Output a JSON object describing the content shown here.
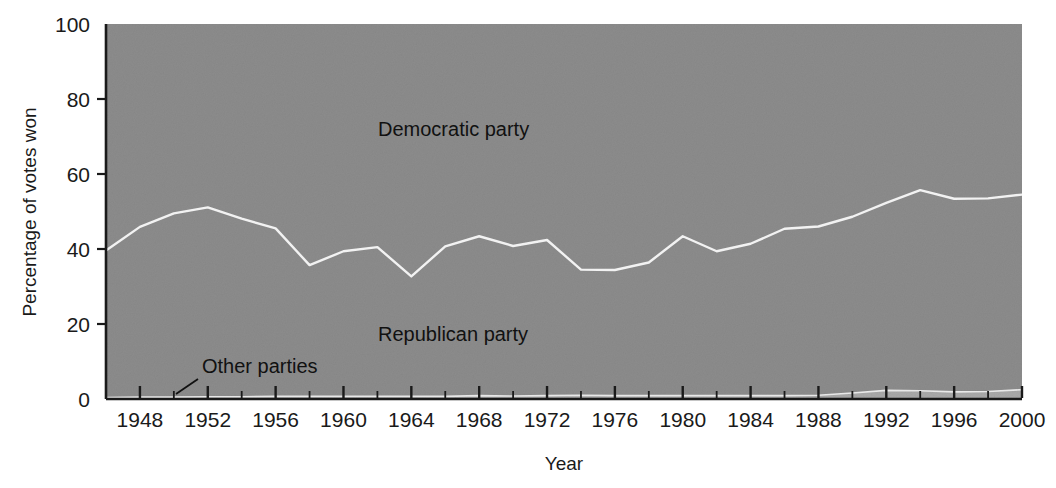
{
  "chart_data": {
    "type": "area",
    "title": "",
    "subtitle": "",
    "xlabel": "Year",
    "ylabel": "Percentage of votes won",
    "xlim": [
      1946,
      2000
    ],
    "ylim": [
      0,
      100
    ],
    "grid": false,
    "stacked": true,
    "stack_total": 100,
    "legend_position": "inline-annotations",
    "x_tick_labels": [
      "1948",
      "1952",
      "1956",
      "1960",
      "1964",
      "1968",
      "1972",
      "1976",
      "1980",
      "1984",
      "1988",
      "1992",
      "1996",
      "2000"
    ],
    "x_tick_values": [
      1948,
      1952,
      1956,
      1960,
      1964,
      1968,
      1972,
      1976,
      1980,
      1984,
      1988,
      1992,
      1996,
      2000
    ],
    "x_minor_tick_interval": 2,
    "y_tick_labels": [
      "0",
      "20",
      "40",
      "60",
      "80",
      "100"
    ],
    "y_tick_values": [
      0,
      20,
      40,
      60,
      80,
      100
    ],
    "x": [
      1946,
      1948,
      1950,
      1952,
      1954,
      1956,
      1958,
      1960,
      1962,
      1964,
      1966,
      1968,
      1970,
      1972,
      1974,
      1976,
      1978,
      1980,
      1982,
      1984,
      1986,
      1988,
      1990,
      1992,
      1994,
      1996,
      1998,
      2000
    ],
    "series": [
      {
        "name": "Other parties",
        "color": "#a9a9a9",
        "values": [
          0.4,
          0.5,
          0.5,
          0.6,
          0.6,
          0.7,
          0.7,
          0.7,
          0.7,
          0.7,
          0.7,
          0.9,
          0.8,
          0.9,
          1.0,
          0.9,
          0.9,
          0.9,
          0.9,
          0.9,
          0.9,
          1.0,
          1.6,
          2.3,
          2.2,
          1.9,
          2.0,
          2.5
        ]
      },
      {
        "name": "Republican party",
        "color": "#8c8c8c",
        "values": [
          39.2,
          45.4,
          49.0,
          50.5,
          47.5,
          44.8,
          35.0,
          38.7,
          39.8,
          32.0,
          40.0,
          42.5,
          40.0,
          41.5,
          33.5,
          33.5,
          35.5,
          42.5,
          38.5,
          40.5,
          44.5,
          45.0,
          47.0,
          50.0,
          53.5,
          51.5,
          51.5,
          52.0
        ]
      },
      {
        "name": "Democratic party",
        "color": "#8c8c8c",
        "values": [
          60.4,
          54.1,
          50.5,
          48.9,
          51.9,
          54.5,
          64.3,
          60.6,
          59.5,
          67.3,
          59.3,
          56.6,
          59.2,
          57.6,
          65.5,
          65.6,
          63.6,
          56.6,
          60.6,
          58.6,
          54.6,
          54.0,
          51.4,
          47.7,
          44.3,
          46.6,
          46.5,
          45.5
        ]
      }
    ],
    "annotations": [
      {
        "name": "democratic-party-label",
        "text": "Democratic party",
        "x_px": 378,
        "y_px": 136
      },
      {
        "name": "republican-party-label",
        "text": "Republican party",
        "x_px": 378,
        "y_px": 341
      },
      {
        "name": "other-parties-label",
        "text": "Other parties",
        "x_px": 202,
        "y_px": 373,
        "leader_line": true
      }
    ],
    "colors": {
      "background": "#ffffff",
      "democratic_band": "#8c8c8c",
      "republican_band": "#8c8c8c",
      "other_band": "#a9a9a9",
      "divider_line": "#ffffff",
      "axis": "#1a1a1a",
      "text": "#1a1a1a"
    }
  }
}
